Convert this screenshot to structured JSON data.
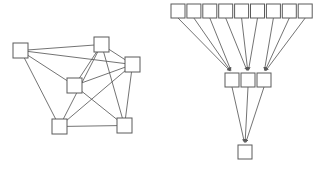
{
  "figure": {
    "title": "",
    "background_color": "#ffffff",
    "node_fill": "#ffffff",
    "node_stroke": "#5a5a5a",
    "edge_color": "#5a5a5a",
    "width": 322,
    "height": 170
  },
  "chart_data": {
    "type": "diagram",
    "title": "",
    "subtitle": "",
    "xlabel": "",
    "ylabel": "",
    "panels": [
      {
        "name": "random-graph",
        "label": "",
        "node_size": 15,
        "node_count": 7,
        "edge_count": 13,
        "nodes": [
          {
            "id": "L0",
            "label": "",
            "x": 13,
            "y": 43
          },
          {
            "id": "L1",
            "label": "",
            "x": 94,
            "y": 37
          },
          {
            "id": "L2",
            "label": "",
            "x": 125,
            "y": 57
          },
          {
            "id": "L3",
            "label": "",
            "x": 67,
            "y": 78
          },
          {
            "id": "L4",
            "label": "",
            "x": 52,
            "y": 119
          },
          {
            "id": "L5",
            "label": "",
            "x": 117,
            "y": 118
          }
        ],
        "edges": [
          {
            "from": "L0",
            "to": "L1"
          },
          {
            "from": "L0",
            "to": "L2"
          },
          {
            "from": "L0",
            "to": "L3"
          },
          {
            "from": "L0",
            "to": "L4"
          },
          {
            "from": "L1",
            "to": "L2"
          },
          {
            "from": "L1",
            "to": "L3"
          },
          {
            "from": "L1",
            "to": "L4"
          },
          {
            "from": "L1",
            "to": "L5"
          },
          {
            "from": "L2",
            "to": "L3"
          },
          {
            "from": "L2",
            "to": "L4"
          },
          {
            "from": "L2",
            "to": "L5"
          },
          {
            "from": "L3",
            "to": "L5"
          },
          {
            "from": "L4",
            "to": "L5"
          }
        ]
      },
      {
        "name": "funnel-hierarchy",
        "label": "",
        "node_size": 14,
        "layers": [
          {
            "name": "top-layer",
            "count": 9,
            "y": 4,
            "x_start": 171,
            "x_step": 15.9
          },
          {
            "name": "middle-layer",
            "count": 3,
            "y": 73,
            "x_start": 225,
            "x_step": 16
          },
          {
            "name": "bottom-layer",
            "count": 1,
            "y": 145,
            "x_start": 238,
            "x_step": 16
          }
        ],
        "arrows": [
          {
            "from_layer": 0,
            "from_index": 0,
            "to_layer": 1,
            "to_index": 0
          },
          {
            "from_layer": 0,
            "from_index": 1,
            "to_layer": 1,
            "to_index": 0
          },
          {
            "from_layer": 0,
            "from_index": 2,
            "to_layer": 1,
            "to_index": 0
          },
          {
            "from_layer": 0,
            "from_index": 3,
            "to_layer": 1,
            "to_index": 1
          },
          {
            "from_layer": 0,
            "from_index": 4,
            "to_layer": 1,
            "to_index": 1
          },
          {
            "from_layer": 0,
            "from_index": 5,
            "to_layer": 1,
            "to_index": 1
          },
          {
            "from_layer": 0,
            "from_index": 6,
            "to_layer": 1,
            "to_index": 2
          },
          {
            "from_layer": 0,
            "from_index": 7,
            "to_layer": 1,
            "to_index": 2
          },
          {
            "from_layer": 0,
            "from_index": 8,
            "to_layer": 1,
            "to_index": 2
          },
          {
            "from_layer": 1,
            "from_index": 0,
            "to_layer": 2,
            "to_index": 0
          },
          {
            "from_layer": 1,
            "from_index": 1,
            "to_layer": 2,
            "to_index": 0
          },
          {
            "from_layer": 1,
            "from_index": 2,
            "to_layer": 2,
            "to_index": 0
          }
        ]
      }
    ]
  }
}
